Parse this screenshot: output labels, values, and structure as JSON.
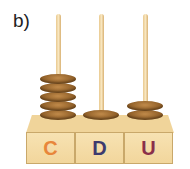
{
  "label": "b)",
  "abacus": {
    "columns": [
      {
        "letter": "C",
        "color": "#e8863a",
        "rings": 5
      },
      {
        "letter": "D",
        "color": "#3d3a6e",
        "rings": 1
      },
      {
        "letter": "U",
        "color": "#8a2f4a",
        "rings": 2
      }
    ]
  }
}
